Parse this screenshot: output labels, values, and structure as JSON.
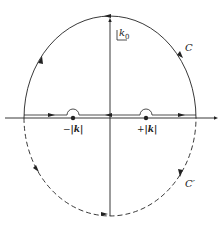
{
  "diagram": {
    "title": "",
    "axis_label": "k0",
    "axis_label_main": "k",
    "axis_label_sub": "0",
    "contour_upper": "C",
    "contour_lower": "C′",
    "poles": [
      {
        "sign": "−",
        "label": "|k|"
      },
      {
        "sign": "+",
        "label": "|k|"
      }
    ],
    "colors": {
      "stroke": "#222222",
      "background": "#ffffff"
    }
  }
}
